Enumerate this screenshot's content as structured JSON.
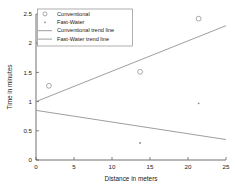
{
  "chart_data": {
    "type": "scatter",
    "title": "",
    "xlabel": "Distance in meters",
    "ylabel": "Time in minutes",
    "xlim": [
      0,
      25
    ],
    "ylim": [
      0,
      2.5
    ],
    "xticks": [
      0,
      5,
      10,
      15,
      20,
      25
    ],
    "yticks": [
      0,
      0.5,
      1,
      1.5,
      2,
      2.5
    ],
    "xtick_labels": [
      "0",
      "5",
      "10",
      "15",
      "20",
      "25"
    ],
    "ytick_labels": [
      "0",
      "0.5",
      "1",
      "1.5",
      "2",
      "2.5"
    ],
    "grid": false,
    "legend_position": "top-left",
    "series": [
      {
        "name": "Conventional",
        "marker": "open-circle",
        "color": "#8c8c8c",
        "points": [
          {
            "x": 1.7,
            "y": 1.27
          },
          {
            "x": 13.7,
            "y": 1.51
          },
          {
            "x": 21.4,
            "y": 2.42
          }
        ]
      },
      {
        "name": "Fast-Water",
        "marker": "dot",
        "color": "#8c8c8c",
        "points": [
          {
            "x": 13.7,
            "y": 0.29
          },
          {
            "x": 21.4,
            "y": 0.97
          }
        ]
      }
    ],
    "trend_lines": [
      {
        "name": "Conventional trend line",
        "color": "#8c8c8c",
        "x_start": 0,
        "y_start": 1.0,
        "x_end": 25,
        "y_end": 2.3
      },
      {
        "name": "Fast-Water trend line",
        "color": "#8c8c8c",
        "x_start": 0,
        "y_start": 0.85,
        "x_end": 25,
        "y_end": 0.35
      }
    ],
    "legend_entries": [
      {
        "label": "Conventional",
        "symbol": "open-circle"
      },
      {
        "label": "Fast-Water",
        "symbol": "dot"
      },
      {
        "label": "Conventional trend line",
        "symbol": "line"
      },
      {
        "label": "Fast-Water trend line",
        "symbol": "line"
      }
    ]
  }
}
